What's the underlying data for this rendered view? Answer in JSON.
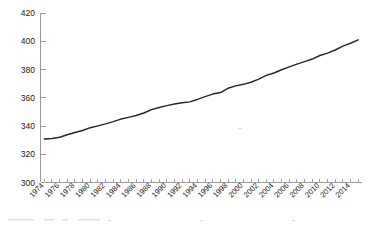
{
  "chart_data": {
    "type": "line",
    "title": "",
    "subtitle": "",
    "xlabel": "",
    "ylabel": "",
    "xlim": [
      1973.5,
      2015.5
    ],
    "ylim": [
      300,
      420
    ],
    "grid": false,
    "legend": null,
    "legend_position": "none",
    "y_ticks": [
      300,
      320,
      340,
      360,
      380,
      400,
      420
    ],
    "y_tick_labels": [
      "300",
      "320",
      "340",
      "360",
      "380",
      "400",
      "420"
    ],
    "x_tick_labels": [
      "1974",
      "1976",
      "1978",
      "1980",
      "1982",
      "1984",
      "1986",
      "1988",
      "1990",
      "1992",
      "1994",
      "1996",
      "1998",
      "2000",
      "2002",
      "2004",
      "2006",
      "2008",
      "2010",
      "2012",
      "2014"
    ],
    "x_tick_label_step": 2,
    "x_minor_tick_step": 1,
    "line_color": "#262626",
    "axis_color": "#9a9a9a",
    "series": [
      {
        "name": "",
        "x": [
          1974,
          1975,
          1976,
          1977,
          1978,
          1979,
          1980,
          1981,
          1982,
          1983,
          1984,
          1985,
          1986,
          1987,
          1988,
          1989,
          1990,
          1991,
          1992,
          1993,
          1994,
          1995,
          1996,
          1997,
          1998,
          1999,
          2000,
          2001,
          2002,
          2003,
          2004,
          2005,
          2006,
          2007,
          2008,
          2009,
          2010,
          2011,
          2012,
          2013,
          2014,
          2015
        ],
        "values": [
          330.8,
          331.1,
          332.0,
          333.8,
          335.4,
          336.8,
          338.8,
          340.1,
          341.5,
          343.1,
          344.9,
          346.1,
          347.4,
          349.2,
          351.6,
          353.1,
          354.4,
          355.6,
          356.4,
          357.1,
          358.8,
          360.8,
          362.6,
          363.7,
          366.7,
          368.4,
          369.5,
          371.0,
          373.2,
          375.8,
          377.5,
          379.8,
          381.9,
          383.8,
          385.6,
          387.4,
          389.9,
          391.6,
          393.8,
          396.5,
          398.6,
          401.0
        ]
      }
    ]
  }
}
